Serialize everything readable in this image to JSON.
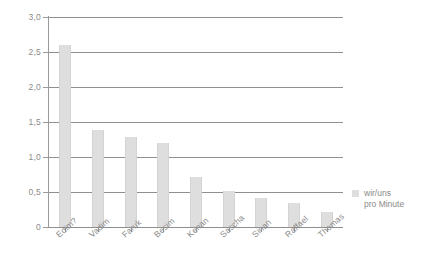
{
  "chart_data": {
    "type": "bar",
    "title": "",
    "subtitle": "",
    "xlabel": "",
    "ylabel": "",
    "ylim": [
      0,
      3.0
    ],
    "ytick_labels": [
      "0",
      "0,5",
      "1,0",
      "1,5",
      "2,0",
      "2,5",
      "3,0"
    ],
    "ytick_values": [
      0,
      0.5,
      1.0,
      1.5,
      2.0,
      2.5,
      3.0
    ],
    "grid": "horizontal",
    "legend_position": "right",
    "categories": [
      "Edim?",
      "Vadim",
      "Faruk",
      "Besim",
      "Kenan",
      "Sascha",
      "Sinan",
      "Raffael",
      "Thomas"
    ],
    "values": [
      2.6,
      1.38,
      1.28,
      1.2,
      0.72,
      0.52,
      0.42,
      0.35,
      0.22
    ],
    "series": [
      {
        "name": "wir/uns pro Minute",
        "values": [
          2.6,
          1.38,
          1.28,
          1.2,
          0.72,
          0.52,
          0.42,
          0.35,
          0.22
        ]
      }
    ],
    "legend": [
      {
        "label_line1": "wir/uns",
        "label_line2": "pro Minute",
        "color": "#dedede"
      }
    ],
    "colors": {
      "bar": "#dedede",
      "gridline": "#8f8f8f",
      "axis": "#9a9a9a",
      "text": "#8a8a8a",
      "background": "#ffffff"
    }
  }
}
